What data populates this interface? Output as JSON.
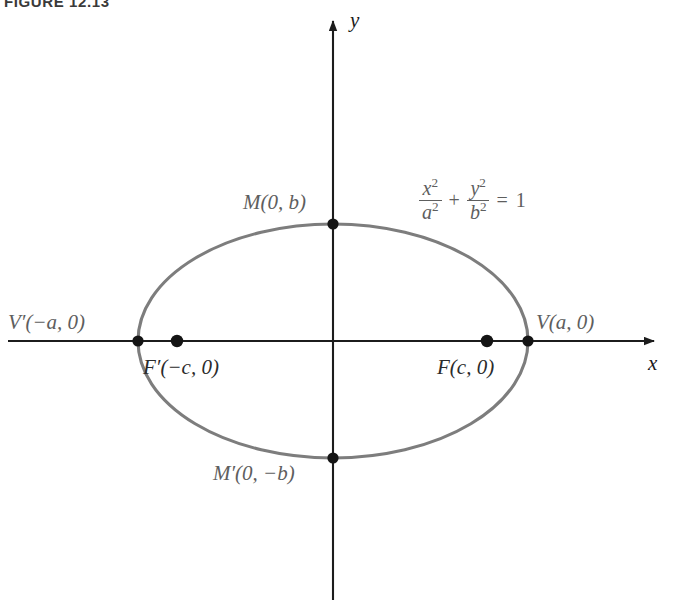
{
  "figure": {
    "caption": "FIGURE 12.13",
    "type": "ellipse-diagram",
    "colors": {
      "curve": "#7d7d7d",
      "axis": "#1c1c1c",
      "point_marker": "#141414",
      "label_gray": "#5e5e5e",
      "label_dark": "#2b2b2b",
      "background": "#ffffff"
    }
  },
  "axes": {
    "x_label": "x",
    "y_label": "y",
    "origin": {
      "x": 333,
      "y": 341
    },
    "x_axis": {
      "x1": 8,
      "y1": 341,
      "x2": 660,
      "y2": 341,
      "arrow": "right"
    },
    "y_axis": {
      "x1": 333,
      "y1": 600,
      "x2": 333,
      "y2": 14,
      "arrow": "up"
    }
  },
  "ellipse": {
    "equation_parts": {
      "x_num": "x",
      "x_den": "a",
      "y_num": "y",
      "y_den": "b",
      "exponent": "2",
      "plus": "+",
      "equals": "=",
      "rhs": "1"
    },
    "equation_text": "x²/a² + y²/b² = 1",
    "center": {
      "x": 333,
      "y": 341
    },
    "semi_major_a_px": 195,
    "semi_minor_b_px": 117,
    "focal_distance_c_px": 156
  },
  "points": [
    {
      "id": "vertex-left",
      "label": "V′(−a, 0)",
      "label_x": 8,
      "label_y": 310,
      "dot": false,
      "tone": "gray"
    },
    {
      "id": "vertex-right",
      "label": "V(a, 0)",
      "label_x": 536,
      "label_y": 310,
      "dot": true,
      "dot_x": 528,
      "dot_y": 341,
      "tone": "gray"
    },
    {
      "id": "covertex-top",
      "label": "M(0, b)",
      "label_x": 243,
      "label_y": 190,
      "dot": true,
      "dot_x": 333,
      "dot_y": 224,
      "tone": "gray"
    },
    {
      "id": "covertex-bottom",
      "label": "M′(0, −b)",
      "label_x": 213,
      "label_y": 461,
      "dot": true,
      "dot_x": 333,
      "dot_y": 458,
      "tone": "gray"
    },
    {
      "id": "focus-left",
      "label": "F′(−c, 0)",
      "label_x": 143,
      "label_y": 355,
      "dot": true,
      "dot_x": 177,
      "dot_y": 341,
      "tone": "dark"
    },
    {
      "id": "focus-right",
      "label": "F(c, 0)",
      "label_x": 437,
      "label_y": 355,
      "dot": true,
      "dot_x": 487,
      "dot_y": 341,
      "tone": "dark"
    }
  ]
}
